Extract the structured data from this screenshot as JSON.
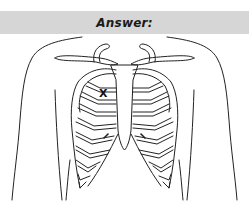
{
  "banner": {
    "label": "Answer:",
    "background": "#d6d6d6"
  },
  "figure": {
    "marker": {
      "label": "X",
      "position_hint": "left upper chest, beside sternum (2nd intercostal space)"
    }
  }
}
